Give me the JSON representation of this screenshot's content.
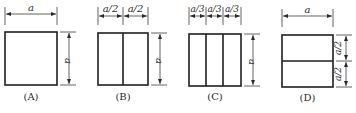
{
  "figures": [
    {
      "id": "A",
      "caption": "(A)",
      "top_labels": [
        "a"
      ],
      "side_labels": [
        "a"
      ],
      "divisions": "none"
    },
    {
      "id": "B",
      "caption": "(B)",
      "top_labels": [
        "a/2",
        "a/2"
      ],
      "side_labels": [
        "a"
      ],
      "divisions": "2 vertical strips"
    },
    {
      "id": "C",
      "caption": "(C)",
      "top_labels": [
        "a/3",
        "a/3",
        "a/3"
      ],
      "side_labels": [
        "a"
      ],
      "divisions": "3 vertical strips"
    },
    {
      "id": "D",
      "caption": "(D)",
      "top_labels": [
        "a"
      ],
      "side_labels": [
        "a/2",
        "a/2"
      ],
      "divisions": "2 horizontal strips"
    }
  ],
  "colors": {
    "line": "#1e1e1e",
    "background": "#ffffff"
  }
}
